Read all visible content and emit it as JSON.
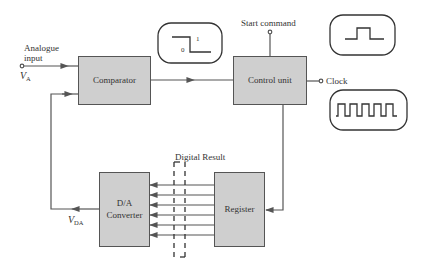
{
  "diagram": {
    "blocks": {
      "comparator": "Comparator",
      "control_unit": "Control unit",
      "dac_line1": "D/A",
      "dac_line2": "Converter",
      "register": "Register"
    },
    "labels": {
      "analogue_input_line1": "Analogue",
      "analogue_input_line2": "input",
      "va_symbol": "V",
      "va_sub": "A",
      "vda_symbol": "V",
      "vda_sub": "DA",
      "start_command": "Start command",
      "clock": "Clock",
      "digital_result": "Digital Result",
      "step_high": "1",
      "step_low": "0"
    },
    "waveform_insets": [
      {
        "name": "comparator-output-step",
        "shape": "step high-to-low",
        "labels": [
          "1",
          "0"
        ]
      },
      {
        "name": "start-pulse",
        "shape": "single pulse"
      },
      {
        "name": "clock-train",
        "shape": "square wave",
        "pulses": 5
      }
    ],
    "bus": {
      "lines": 6,
      "direction": "register-to-dac"
    },
    "colors": {
      "block_fill": "#cfcfcf",
      "stroke": "#555555",
      "background": "#ffffff"
    }
  }
}
